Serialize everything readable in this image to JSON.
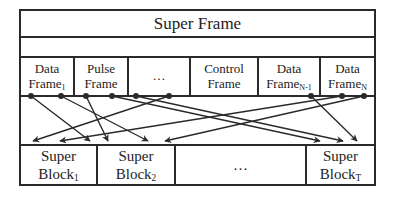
{
  "diagram": {
    "super_frame": {
      "label": "Super Frame"
    },
    "frames": [
      {
        "line1": "Data",
        "line2": "Frame",
        "sub": "1"
      },
      {
        "line1": "Pulse",
        "line2": "Frame",
        "sub": ""
      },
      {
        "line1": "…",
        "line2": "",
        "sub": ""
      },
      {
        "line1": "Control",
        "line2": "Frame",
        "sub": ""
      },
      {
        "line1": "Data",
        "line2": "Frame",
        "sub": "N-1"
      },
      {
        "line1": "Data",
        "line2": "Frame",
        "sub": "N"
      }
    ],
    "blocks": [
      {
        "line1": "Super",
        "line2": "Block",
        "sub": "1"
      },
      {
        "line1": "Super",
        "line2": "Block",
        "sub": "2"
      },
      {
        "line1": "…",
        "line2": "",
        "sub": ""
      },
      {
        "line1": "Super",
        "line2": "Block",
        "sub": "T"
      }
    ],
    "connections": [
      {
        "from_x": 31,
        "to_x": 90
      },
      {
        "from_x": 61,
        "to_x": 148
      },
      {
        "from_x": 86,
        "to_x": 108
      },
      {
        "from_x": 112,
        "to_x": 320
      },
      {
        "from_x": 136,
        "to_x": 343
      },
      {
        "from_x": 169,
        "to_x": 33
      },
      {
        "from_x": 311,
        "to_x": 357
      },
      {
        "from_x": 342,
        "to_x": 60
      },
      {
        "from_x": 364,
        "to_x": 165
      }
    ],
    "colors": {
      "line": "#2a2a2a",
      "background": "#ffffff"
    }
  }
}
